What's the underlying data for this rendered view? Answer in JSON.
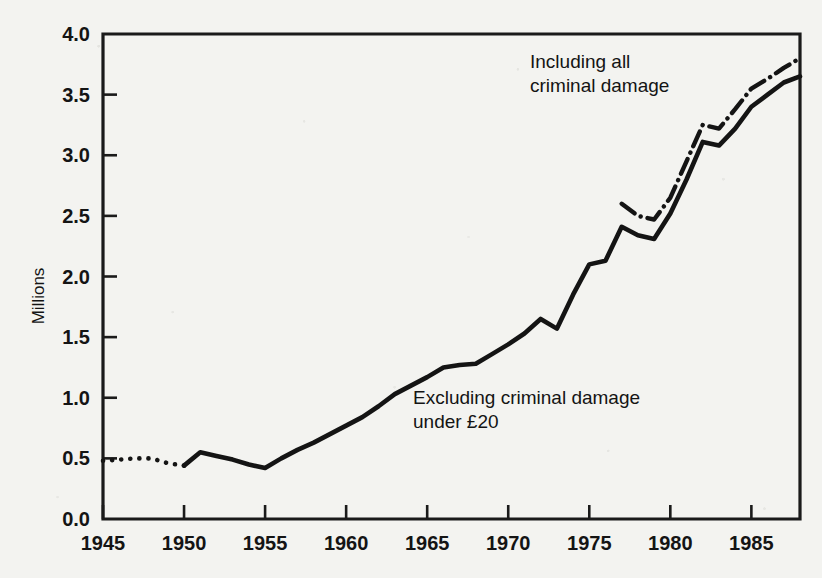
{
  "chart_data": {
    "type": "line",
    "title": "",
    "xlabel": "",
    "ylabel": "Millions",
    "xlim": [
      1945,
      1988
    ],
    "ylim": [
      0.0,
      4.0
    ],
    "grid": false,
    "legend_position": "inline-annotations",
    "x_ticks": [
      1945,
      1950,
      1955,
      1960,
      1965,
      1970,
      1975,
      1980,
      1985
    ],
    "x_tick_labels": [
      "1945",
      "1950",
      "1955",
      "1960",
      "1965",
      "1970",
      "1975",
      "1980",
      "1985"
    ],
    "y_ticks": [
      0.0,
      0.5,
      1.0,
      1.5,
      2.0,
      2.5,
      3.0,
      3.5,
      4.0
    ],
    "y_tick_labels": [
      "0.0",
      "0.5",
      "1.0",
      "1.5",
      "2.0",
      "2.5",
      "3.0",
      "3.5",
      "4.0"
    ],
    "series": [
      {
        "name": "Excluding criminal damage under £20",
        "style": "dotted",
        "note": "early estimated portion 1945-1950",
        "x": [
          1945,
          1946,
          1947,
          1948,
          1949,
          1950
        ],
        "values": [
          0.48,
          0.49,
          0.5,
          0.5,
          0.46,
          0.44
        ]
      },
      {
        "name": "Excluding criminal damage under £20",
        "style": "solid",
        "x": [
          1950,
          1951,
          1952,
          1953,
          1954,
          1955,
          1956,
          1957,
          1958,
          1959,
          1960,
          1961,
          1962,
          1963,
          1964,
          1965,
          1966,
          1967,
          1968,
          1969,
          1970,
          1971,
          1972,
          1973,
          1974,
          1975,
          1976,
          1977,
          1978,
          1979,
          1980,
          1981,
          1982,
          1983,
          1984,
          1985,
          1986,
          1987,
          1988
        ],
        "values": [
          0.44,
          0.55,
          0.52,
          0.49,
          0.45,
          0.42,
          0.5,
          0.57,
          0.63,
          0.7,
          0.77,
          0.84,
          0.93,
          1.03,
          1.1,
          1.17,
          1.25,
          1.27,
          1.28,
          1.36,
          1.44,
          1.53,
          1.65,
          1.57,
          1.85,
          2.1,
          2.13,
          2.41,
          2.34,
          2.31,
          2.52,
          2.8,
          3.11,
          3.08,
          3.22,
          3.4,
          3.5,
          3.6,
          3.65
        ]
      },
      {
        "name": "Including all criminal damage",
        "style": "dash-dot",
        "x": [
          1977,
          1978,
          1979,
          1980,
          1981,
          1982,
          1983,
          1984,
          1985,
          1986,
          1987,
          1988
        ],
        "values": [
          2.6,
          2.5,
          2.47,
          2.65,
          2.95,
          3.25,
          3.22,
          3.38,
          3.55,
          3.63,
          3.72,
          3.8
        ]
      }
    ],
    "annotations": [
      {
        "id": "including-all",
        "line1": "Including all",
        "line2": "criminal damage",
        "x": 1980,
        "y": 3.62
      },
      {
        "id": "excluding-under-20",
        "line1": "Excluding criminal damage",
        "line2": "under £20",
        "x": 1964,
        "y": 1.02
      }
    ],
    "colors": {
      "ink": "#141414",
      "paper": "#f3f3f0"
    }
  }
}
